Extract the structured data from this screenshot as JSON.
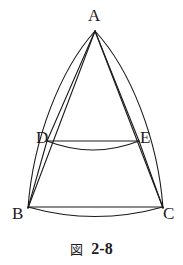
{
  "figure": {
    "caption_kanji": "図",
    "caption_number": "2-8",
    "stroke_color": "#1b1b1b",
    "background_color": "#ffffff",
    "vertices": [
      {
        "name": "A",
        "label": "A",
        "x": 95,
        "y": 31
      },
      {
        "name": "B",
        "label": "B",
        "x": 28,
        "y": 208
      },
      {
        "name": "C",
        "label": "C",
        "x": 163,
        "y": 208
      },
      {
        "name": "D",
        "label": "D",
        "x": 47,
        "y": 141
      },
      {
        "name": "E",
        "label": "E",
        "x": 139,
        "y": 141
      }
    ],
    "segments": [
      {
        "name": "segment-AB",
        "from": "A",
        "to": "B",
        "kind": "straight"
      },
      {
        "name": "segment-AC",
        "from": "A",
        "to": "C",
        "kind": "straight"
      },
      {
        "name": "segment-AD",
        "from": "A",
        "to": "D",
        "kind": "straight"
      },
      {
        "name": "segment-AE",
        "from": "A",
        "to": "E",
        "kind": "straight"
      },
      {
        "name": "segment-DB",
        "from": "D",
        "to": "B",
        "kind": "straight"
      },
      {
        "name": "segment-EC",
        "from": "E",
        "to": "C",
        "kind": "straight"
      },
      {
        "name": "segment-DE",
        "from": "D",
        "to": "E",
        "kind": "straight"
      },
      {
        "name": "segment-BC",
        "from": "B",
        "to": "C",
        "kind": "straight"
      }
    ],
    "arcs": [
      {
        "name": "arc-AB-outer",
        "from": "A",
        "to": "B",
        "bulge": "left"
      },
      {
        "name": "arc-AC-outer",
        "from": "A",
        "to": "C",
        "bulge": "right"
      },
      {
        "name": "arc-DE-lower",
        "from": "D",
        "to": "E",
        "bulge": "down"
      },
      {
        "name": "arc-BC-lower",
        "from": "B",
        "to": "C",
        "bulge": "down"
      }
    ]
  }
}
